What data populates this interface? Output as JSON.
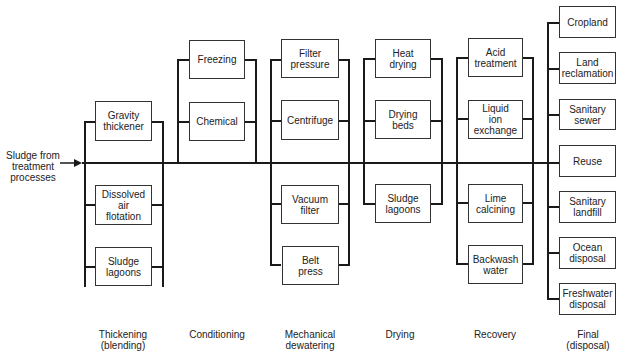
{
  "input": {
    "label": "Sludge from\ntreatment\nprocesses"
  },
  "stages": [
    {
      "name": "Thickening\n(blending)",
      "options": [
        "Gravity\nthickener",
        "Dissolved\nair\nflotation",
        "Sludge\nlagoons"
      ]
    },
    {
      "name": "Conditioning",
      "options": [
        "Freezing",
        "Chemical"
      ]
    },
    {
      "name": "Mechanical\ndewatering",
      "options": [
        "Filter\npressure",
        "Centrifuge",
        "Vacuum\nfilter",
        "Belt\npress"
      ]
    },
    {
      "name": "Drying",
      "options": [
        "Heat\ndrying",
        "Drying\nbeds",
        "Sludge\nlagoons"
      ]
    },
    {
      "name": "Recovery",
      "options": [
        "Acid\ntreatment",
        "Liquid\nion exchange",
        "Lime\ncalcining",
        "Backwash\nwater"
      ]
    },
    {
      "name": "Final\n(disposal)",
      "options": [
        "Cropland",
        "Land\nreclamation",
        "Sanitary\nsewer",
        "Reuse",
        "Sanitary\nlandfill",
        "Ocean\ndisposal",
        "Freshwater\ndisposal"
      ]
    }
  ]
}
